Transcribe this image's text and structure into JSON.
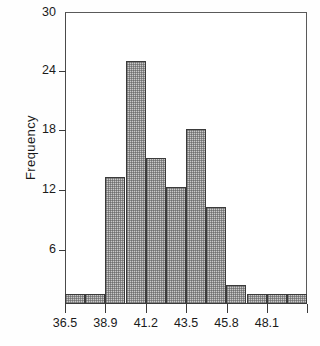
{
  "chart_data": {
    "type": "bar",
    "title": "",
    "subtitle": "",
    "xlabel": "",
    "ylabel": "Frequency",
    "grid": false,
    "legend": false,
    "legend_position": "none",
    "bin_width": 1.15,
    "bin_edges": [
      36.5,
      37.65,
      38.8,
      39.95,
      41.1,
      42.25,
      43.4,
      44.55,
      45.7,
      46.85,
      48.0,
      49.15,
      50.3
    ],
    "categories": [
      "36.5-37.7",
      "37.7-38.8",
      "38.8-40.0",
      "40.0-41.1",
      "41.1-42.3",
      "42.3-43.4",
      "43.4-44.6",
      "44.6-45.7",
      "45.7-46.9",
      "46.9-48.0",
      "48.0-49.2",
      "49.2-50.3"
    ],
    "values": [
      1,
      1,
      13,
      25,
      15,
      12,
      18,
      10,
      2,
      1,
      1,
      1
    ],
    "xlim": [
      36.5,
      50.3
    ],
    "ylim": [
      0,
      30
    ],
    "yticks": [
      30,
      24,
      18,
      12,
      6
    ],
    "ytick_labels": [
      "30",
      "24",
      "18",
      "12",
      "6"
    ],
    "xticks": [
      36.5,
      38.9,
      41.2,
      43.5,
      45.8,
      48.1
    ],
    "xtick_labels": [
      "36.5",
      "38.9",
      "41.2",
      "43.5",
      "45.8",
      "48.1"
    ],
    "bar_face_color": "#c9c9c9",
    "bar_edge_color": "#3b3b3b",
    "axis_color": "#4a4a4a",
    "background_color": "#ffffff"
  }
}
